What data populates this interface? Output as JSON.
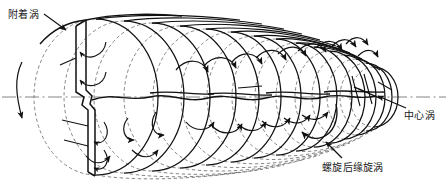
{
  "figure": {
    "kind": "propeller-vortex-system-schematic",
    "background_color": "#ffffff",
    "line_color": "#1a1a1a",
    "dashed_color": "#6b6b6b",
    "axis_color": "#555555"
  },
  "labels": {
    "attached_vortex": "附着涡",
    "center_vortex": "中心涡",
    "helical_trailing_edge_vortex": "螺旋后缘旋涡"
  },
  "annotations": {
    "attached_vortex_leader": "leader-line-down-right",
    "center_vortex_leader": "leader-line-up-left",
    "helical_vortex_leader": "leader-line-up-left",
    "rotation_arrow": "blade-rotation-direction-arc"
  },
  "geometry": {
    "axis_y": 97,
    "blade_x": 88,
    "coil_centers_x": [
      96,
      124,
      152,
      180,
      206,
      231,
      254,
      276,
      296,
      314,
      330,
      344,
      356,
      366,
      374
    ],
    "coil_radii_x": [
      62,
      60,
      58,
      56,
      53,
      50,
      47,
      44,
      41,
      38,
      35,
      32,
      29,
      26,
      24
    ],
    "coil_radii_y": [
      78,
      76,
      74,
      71,
      68,
      65,
      61,
      58,
      54,
      50,
      46,
      42,
      38,
      34,
      30
    ]
  }
}
